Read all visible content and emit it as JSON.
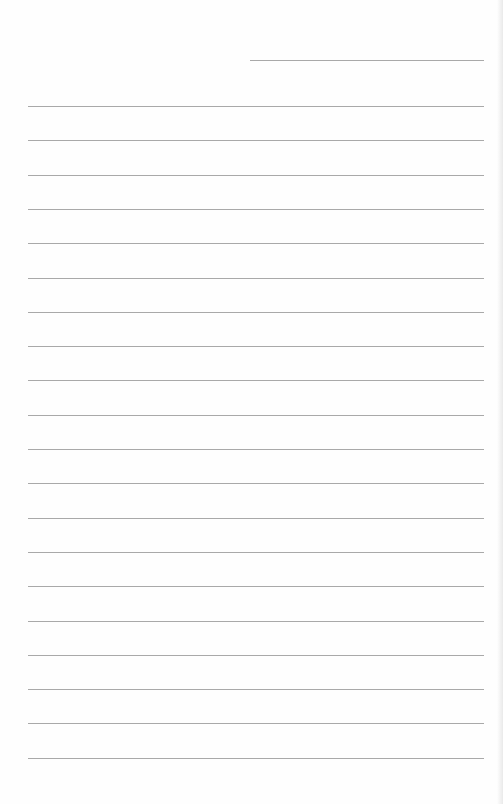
{
  "document": {
    "type": "lined-paper",
    "background_color": "#fefefe",
    "line_color": "#a9a9a9",
    "header_line": {
      "present": true,
      "label": ""
    },
    "ruled_lines_count": 20,
    "ruled_lines": [
      "",
      "",
      "",
      "",
      "",
      "",
      "",
      "",
      "",
      "",
      "",
      "",
      "",
      "",
      "",
      "",
      "",
      "",
      "",
      ""
    ]
  }
}
